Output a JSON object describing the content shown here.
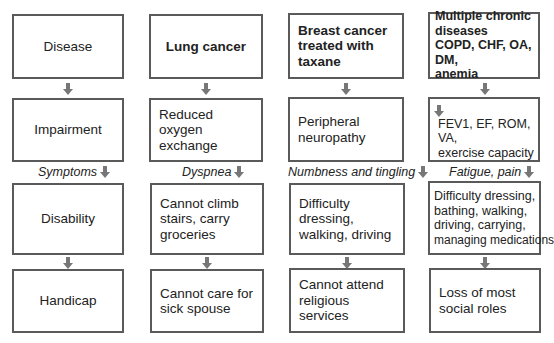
{
  "diagram": {
    "type": "flow",
    "direction": "top-to-bottom",
    "columns": [
      {
        "id": "framework",
        "boxes": [
          {
            "text": "Disease",
            "bold": false
          },
          {
            "text": "Impairment",
            "bold": false
          },
          {
            "text": "Disability",
            "bold": false
          },
          {
            "text": "Handicap",
            "bold": false
          }
        ],
        "transition_label": "Symptoms"
      },
      {
        "id": "lung-cancer",
        "boxes": [
          {
            "text": "Lung cancer",
            "bold": true
          },
          {
            "lines": [
              "Reduced",
              "oxygen",
              "exchange"
            ]
          },
          {
            "lines": [
              "Cannot climb",
              "stairs, carry",
              "groceries"
            ]
          },
          {
            "lines": [
              "Cannot care for",
              "sick spouse"
            ]
          }
        ],
        "transition_label": "Dyspnea"
      },
      {
        "id": "breast-cancer",
        "boxes": [
          {
            "lines": [
              "Breast cancer",
              "treated with",
              "taxane"
            ],
            "bold": true
          },
          {
            "lines": [
              "Peripheral",
              "neuropathy"
            ]
          },
          {
            "lines": [
              "Difficulty",
              "dressing,",
              "walking, driving"
            ]
          },
          {
            "lines": [
              "Cannot attend",
              "religious",
              "services"
            ]
          }
        ],
        "transition_label": "Numbness and tingling"
      },
      {
        "id": "multiple-chronic",
        "boxes": [
          {
            "lines": [
              "Multiple chronic",
              "diseases",
              "COPD, CHF, OA, DM,",
              "anemia"
            ],
            "bold": true
          },
          {
            "prefix_icon": "down-arrow",
            "lines": [
              "FEV1, EF, ROM, VA,",
              "exercise capacity"
            ]
          },
          {
            "lines": [
              "Difficulty dressing,",
              "bathing, walking,",
              "driving, carrying,",
              "managing medications"
            ]
          },
          {
            "lines": [
              "Loss of most",
              "social roles"
            ]
          }
        ],
        "transition_label": "Fatigue, pain"
      }
    ],
    "colors": {
      "box_border": "#5a5a5a",
      "arrow": "#777777",
      "text": "#222222",
      "background": "#ffffff"
    }
  }
}
